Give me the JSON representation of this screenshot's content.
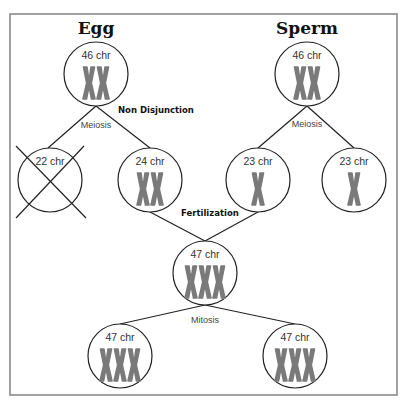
{
  "diagram": {
    "titles": {
      "egg": "Egg",
      "sperm": "Sperm"
    },
    "events": {
      "non_disjunction": "Non Disjunction",
      "fertilization": "Fertilization"
    },
    "processes": {
      "egg_meiosis": "Meiosis",
      "sperm_meiosis": "Meiosis",
      "mitosis": "Mitosis"
    },
    "colors": {
      "line": "#222222",
      "chromosome": "#7a7a7a",
      "frame": "#8a8a8a"
    },
    "cells": [
      {
        "id": "egg-parent",
        "label": "46 chr",
        "chromosomes": 2,
        "crossed_out": false
      },
      {
        "id": "sperm-parent",
        "label": "46 chr",
        "chromosomes": 2,
        "crossed_out": false
      },
      {
        "id": "egg-gamete-a",
        "label": "22 chr",
        "chromosomes": 0,
        "crossed_out": true
      },
      {
        "id": "egg-gamete-b",
        "label": "24 chr",
        "chromosomes": 2,
        "crossed_out": false
      },
      {
        "id": "sperm-gamete-a",
        "label": "23 chr",
        "chromosomes": 1,
        "crossed_out": false
      },
      {
        "id": "sperm-gamete-b",
        "label": "23 chr",
        "chromosomes": 1,
        "crossed_out": false
      },
      {
        "id": "zygote",
        "label": "47 chr",
        "chromosomes": 3,
        "crossed_out": false
      },
      {
        "id": "daughter-a",
        "label": "47 chr",
        "chromosomes": 3,
        "crossed_out": false
      },
      {
        "id": "daughter-b",
        "label": "47 chr",
        "chromosomes": 3,
        "crossed_out": false
      }
    ]
  }
}
